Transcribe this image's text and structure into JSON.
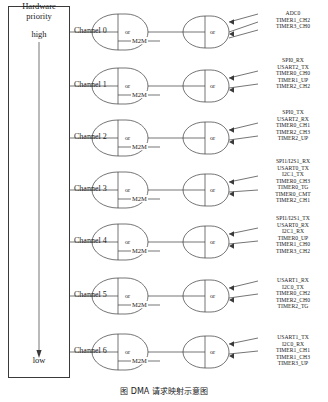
{
  "figure": {
    "caption": "图    DMA 请求映射示意图",
    "priority_box": {
      "title_line1": "Hardware",
      "title_line2": "priority",
      "top_label": "high",
      "bottom_label": "low"
    },
    "gate_label": "or",
    "m2m_label": "M2M",
    "channels": [
      {
        "name": "Channel 0",
        "signals": [
          "ADC0",
          "TIMER1_CH2",
          "TIMER3_CH0"
        ]
      },
      {
        "name": "Channel 1",
        "signals": [
          "SPI0_RX",
          "USART2_TX",
          "TIMER0_CH0",
          "TIMER1_UP",
          "TIMER2_CH2"
        ]
      },
      {
        "name": "Channel 2",
        "signals": [
          "SPI0_TX",
          "USART2_RX",
          "TIMER0_CH1",
          "TIMER2_CH3",
          "TIMER2_UP"
        ]
      },
      {
        "name": "Channel 3",
        "signals": [
          "SPI1/I2S1_RX",
          "USART0_TX",
          "I2C1_TX",
          "TIMER0_CH3",
          "TIMER0_TG",
          "TIMER0_CMT",
          "TIMER2_CH1"
        ]
      },
      {
        "name": "Channel 4",
        "signals": [
          "SPI1/I2S1_TX",
          "USART0_RX",
          "I2C1_RX",
          "TIMER0_UP",
          "TIMER1_CH0",
          "TIMER3_CH2"
        ]
      },
      {
        "name": "Channel 5",
        "signals": [
          "USART1_RX",
          "I2C0_TX",
          "TIMER0_CH2",
          "TIMER2_CH0",
          "TIMER2_TG"
        ]
      },
      {
        "name": "Channel 6",
        "signals": [
          "USART1_TX",
          "I2C0_RX",
          "TIMER1_CH1",
          "TIMER1_CH3",
          "TIMER3_UP"
        ]
      }
    ],
    "colors": {
      "stroke": "#3a3a3a",
      "text": "#1a1a1a",
      "background": "#ffffff"
    }
  }
}
